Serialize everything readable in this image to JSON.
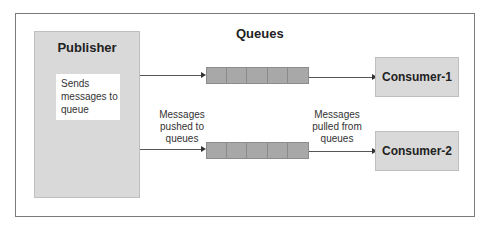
{
  "diagram": {
    "publisher": {
      "title": "Publisher",
      "note": "Sends messages to queue"
    },
    "queues": {
      "title": "Queues",
      "items": [
        {
          "cells": 5
        },
        {
          "cells": 5
        }
      ]
    },
    "consumers": [
      {
        "label": "Consumer-1"
      },
      {
        "label": "Consumer-2"
      }
    ],
    "edge_labels": {
      "push": "Messages pushed to queues",
      "pull": "Messages pulled from queues"
    },
    "colors": {
      "box_fill": "#d9d9d9",
      "queue_fill": "#a6a6a6",
      "frame_border": "#7a7a7a",
      "arrow": "#555555"
    }
  }
}
